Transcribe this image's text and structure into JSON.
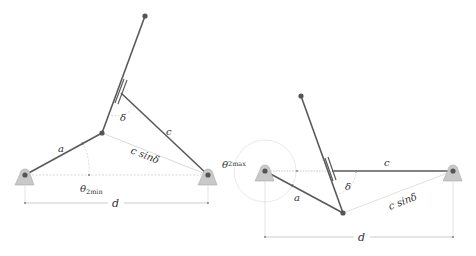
{
  "colors": {
    "link": "#5a5a5a",
    "joint": "#555555",
    "ground_fill": "#c9c9c9",
    "ground_stroke": "#999999",
    "construction": "#cfcfcf",
    "dimension": "#bdbdbd",
    "text": "#333333"
  },
  "left_diagram": {
    "title": "minimum transmission configuration",
    "labels": {
      "a": "a",
      "c": "c",
      "delta": "δ",
      "c_sin_delta": "c sinδ",
      "theta": "θ",
      "theta_sub": "2min",
      "d": "d"
    }
  },
  "right_diagram": {
    "title": "maximum transmission configuration",
    "labels": {
      "a": "a",
      "c": "c",
      "delta": "δ",
      "c_sin_delta": "c sinδ",
      "theta": "θ",
      "theta_sub": "2max",
      "d": "d"
    }
  }
}
